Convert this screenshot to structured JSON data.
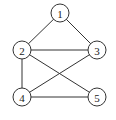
{
  "diagram": {
    "type": "undirected-graph",
    "node_radius": 9,
    "stroke_color": "#333333",
    "nodes": [
      {
        "id": "1",
        "label": "1",
        "x": 60,
        "y": 13
      },
      {
        "id": "2",
        "label": "2",
        "x": 22,
        "y": 50
      },
      {
        "id": "3",
        "label": "3",
        "x": 97,
        "y": 50
      },
      {
        "id": "4",
        "label": "4",
        "x": 22,
        "y": 97
      },
      {
        "id": "5",
        "label": "5",
        "x": 97,
        "y": 97
      }
    ],
    "edges": [
      {
        "from": "1",
        "to": "2"
      },
      {
        "from": "1",
        "to": "3"
      },
      {
        "from": "2",
        "to": "3"
      },
      {
        "from": "2",
        "to": "4"
      },
      {
        "from": "2",
        "to": "5"
      },
      {
        "from": "3",
        "to": "4"
      },
      {
        "from": "4",
        "to": "5"
      }
    ]
  }
}
